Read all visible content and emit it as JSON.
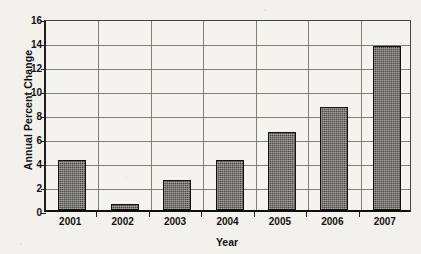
{
  "chart_data": {
    "type": "bar",
    "title": "",
    "categories": [
      "2001",
      "2002",
      "2003",
      "2004",
      "2005",
      "2006",
      "2007"
    ],
    "values": [
      4.2,
      0.5,
      2.5,
      4.2,
      6.5,
      8.6,
      13.7
    ],
    "xlabel": "Year",
    "ylabel": "Annual Percent Change",
    "ylim": [
      0,
      16
    ],
    "ytick_labels": [
      "0",
      "2",
      "4",
      "6",
      "8",
      "10",
      "12",
      "14",
      "16"
    ],
    "ytick_values": [
      0,
      2,
      4,
      6,
      8,
      10,
      12,
      14,
      16
    ],
    "grid": "horizontal and vertical",
    "legend": "none",
    "series_name": "Annual Percent Change",
    "bar_color": "#4b4944",
    "bar_edge_color": "#111111",
    "grid_color": "#6e6b63",
    "background_color": "#f2f1ec"
  }
}
